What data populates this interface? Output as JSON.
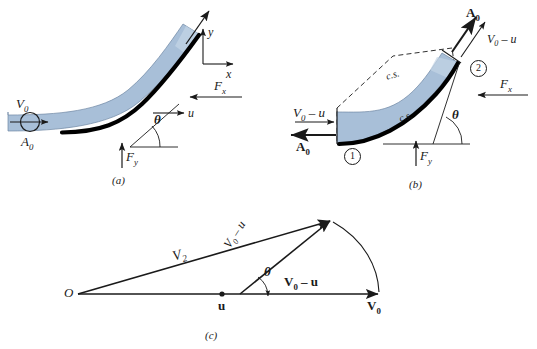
{
  "figure": {
    "colors": {
      "jet_fill": "#a8bfd8",
      "jet_fill_light": "#c3d4e5",
      "vane_dark": "#000000",
      "line": "#1a1a1a",
      "background": "#ffffff"
    }
  },
  "panel_a": {
    "caption": "(a)",
    "labels": {
      "inlet_velocity": "V",
      "inlet_velocity_sub": "0",
      "inlet_area": "A",
      "inlet_area_sub": "0",
      "vane_speed": "u",
      "angle": "θ",
      "force_x": "F",
      "force_x_sub": "x",
      "force_y": "F",
      "force_y_sub": "y",
      "axis_x": "x",
      "axis_y": "y"
    }
  },
  "panel_b": {
    "caption": "(b)",
    "labels": {
      "relative_velocity_in": "V",
      "relative_velocity_in_sub": "0",
      "relative_velocity_in_tail": " – u",
      "area_in": "A",
      "area_in_sub": "0",
      "relative_velocity_out": "V",
      "relative_velocity_out_sub": "0",
      "relative_velocity_out_tail": " – u",
      "area_out": "A",
      "area_out_sub": "0",
      "control_surface_upper": "c.s.",
      "control_surface_lower": "c.s.",
      "station_1": "1",
      "station_2": "2",
      "angle": "θ",
      "force_x": "F",
      "force_x_sub": "x",
      "force_y": "F",
      "force_y_sub": "y"
    }
  },
  "panel_c": {
    "caption": "(c)",
    "labels": {
      "origin": "O",
      "absolute_exit_velocity": "V",
      "absolute_exit_velocity_sub": "2",
      "relative_velocity_vector": "V",
      "relative_velocity_vector_sub": "0",
      "relative_velocity_vector_tail": " – u",
      "relative_velocity_horizontal": "V",
      "relative_velocity_horizontal_sub": "0",
      "relative_velocity_horizontal_tail": " – u",
      "vane_velocity": "u",
      "jet_velocity": "V",
      "jet_velocity_sub": "0",
      "angle": "θ"
    }
  }
}
